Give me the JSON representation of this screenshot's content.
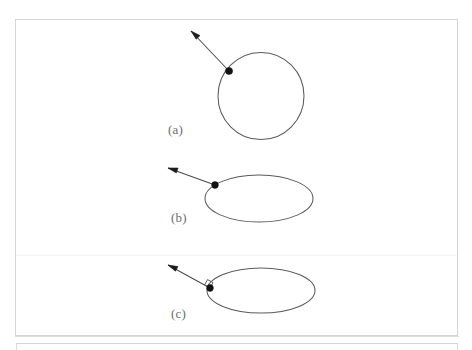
{
  "figure": {
    "background_color": "#ffffff",
    "frame_color": "#d4d4d4",
    "curve_color": "#5b5b5b",
    "vector_color": "#4a4a4a",
    "point_color": "#121212",
    "label_color": "#6d6d6d",
    "panels": [
      {
        "id": "a",
        "label": "(a)",
        "shape": "circle",
        "shape_name": "closed-curve-circle",
        "vector_name": "normal-vector-arrow",
        "base_point_name": "base-point",
        "has_right_angle_marker": false,
        "geometry": {
          "cx": 101,
          "cy": 74,
          "rx": 43,
          "ry": 43.5,
          "base_x": 69,
          "base_y": 49,
          "tip_x": 31,
          "tip_y": 9
        }
      },
      {
        "id": "b",
        "label": "(b)",
        "shape": "ellipse",
        "shape_name": "closed-curve-ellipse",
        "vector_name": "normal-vector-arrow",
        "base_point_name": "base-point",
        "has_right_angle_marker": false,
        "geometry": {
          "cx": 99,
          "cy": 38.5,
          "rx": 54,
          "ry": 23.5,
          "base_x": 55,
          "base_y": 25,
          "tip_x": 8,
          "tip_y": 8
        }
      },
      {
        "id": "c",
        "label": "(c)",
        "shape": "ellipse",
        "shape_name": "closed-curve-ellipse",
        "vector_name": "normal-vector-arrow",
        "base_point_name": "base-point",
        "has_right_angle_marker": true,
        "right_angle_marker_name": "right-angle-marker",
        "geometry": {
          "cx": 101,
          "cy": 32.5,
          "rx": 54,
          "ry": 22.5,
          "base_x": 50,
          "base_y": 30,
          "tip_x": 8,
          "tip_y": 7
        }
      }
    ]
  }
}
